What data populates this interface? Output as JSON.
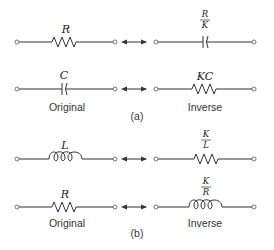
{
  "figure": {
    "part_a": {
      "label": "(a)",
      "rows": [
        {
          "original": {
            "element": "resistor",
            "label": "R"
          },
          "inverse": {
            "element": "capacitor",
            "label_num": "R",
            "label_den": "K"
          }
        },
        {
          "original": {
            "element": "capacitor",
            "label": "C"
          },
          "inverse": {
            "element": "resistor",
            "label": "KC"
          }
        }
      ],
      "original_caption": "Original",
      "inverse_caption": "Inverse"
    },
    "part_b": {
      "label": "(b)",
      "rows": [
        {
          "original": {
            "element": "inductor",
            "label": "L"
          },
          "inverse": {
            "element": "resistor",
            "label_num": "K",
            "label_den": "L"
          }
        },
        {
          "original": {
            "element": "resistor",
            "label": "R"
          },
          "inverse": {
            "element": "inductor",
            "label_num": "K",
            "label_den": "R"
          }
        }
      ],
      "original_caption": "Original",
      "inverse_caption": "Inverse"
    },
    "arrow_icon": "double-headed-arrow"
  }
}
